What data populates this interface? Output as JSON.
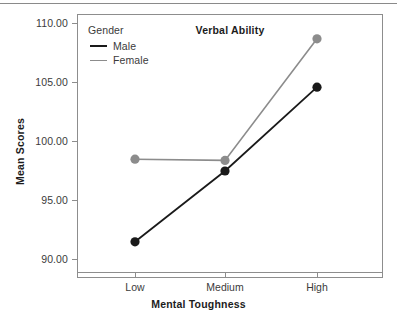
{
  "chart_data": {
    "type": "line",
    "title": "Verbal Ability",
    "xlabel": "Mental Toughness",
    "ylabel": "Mean Scores",
    "categories": [
      "Low",
      "Medium",
      "High"
    ],
    "series": [
      {
        "name": "Male",
        "values": [
          91.5,
          97.5,
          104.6
        ],
        "color": "#1a1a1a"
      },
      {
        "name": "Female",
        "values": [
          98.5,
          98.4,
          108.7
        ],
        "color": "#8c8c8c"
      }
    ],
    "legend_title": "Gender",
    "legend_position": "inside-top-left",
    "ylim": [
      89.0,
      111.0
    ],
    "yticks": [
      90.0,
      95.0,
      100.0,
      105.0,
      110.0
    ],
    "ytick_labels": [
      "90.00",
      "95.00",
      "100.00",
      "105.00",
      "110.00"
    ],
    "grid": false,
    "markers": "filled-circle"
  },
  "figure": {
    "background_color": "#ffffff",
    "frame_color": "#8d8d8d",
    "text_color": "#3b3b3b"
  }
}
